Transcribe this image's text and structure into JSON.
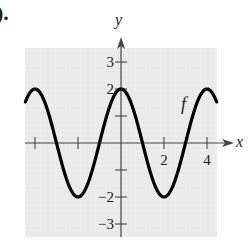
{
  "part_label": ").",
  "chart_data": {
    "type": "line",
    "title": "",
    "xlabel": "x",
    "ylabel": "y",
    "curve_label": "f",
    "function": "f(x) = 2cos(pi*x/2)",
    "xlim": [
      -4.5,
      4.5
    ],
    "ylim": [
      -3.5,
      3.5
    ],
    "x_ticks": [
      -4,
      -2,
      2,
      4
    ],
    "x_tick_labels": [
      "",
      "",
      "2",
      "4"
    ],
    "y_ticks": [
      -3,
      -2,
      -1,
      1,
      2,
      3
    ],
    "y_tick_labels": [
      "−3",
      "−2",
      "",
      "",
      "2",
      "3"
    ],
    "grid": true,
    "series": [
      {
        "name": "f",
        "x": [
          -4.5,
          -4,
          -3,
          -2,
          -1,
          0,
          1,
          2,
          3,
          4,
          4.5
        ],
        "y": [
          1.41,
          2,
          0,
          -2,
          0,
          2,
          0,
          -2,
          0,
          2,
          1.41
        ]
      }
    ],
    "colors": {
      "curve": "#000000",
      "grid_bg": "#e8e8e8",
      "axis": "#333333"
    }
  }
}
